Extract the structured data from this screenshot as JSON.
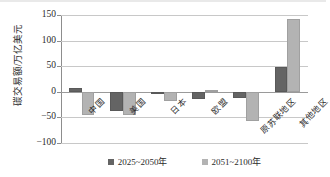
{
  "chart_data": {
    "type": "bar",
    "title": "",
    "xlabel": "",
    "ylabel": "碳交易额/万亿美元",
    "ylim": [
      -100,
      150
    ],
    "yticks": [
      150,
      100,
      50,
      0,
      -50,
      -100
    ],
    "ytick_labels": [
      "150",
      "100",
      "50",
      "0",
      "−50",
      "−100"
    ],
    "grid": true,
    "legend_position": "bottom-center",
    "categories": [
      "中国",
      "美国",
      "日本",
      "欧盟",
      "原苏联地区",
      "其他地区"
    ],
    "series": [
      {
        "name": "2025~2050年",
        "color": "#646464",
        "values": [
          8,
          -38,
          -4,
          -14,
          -12,
          48
        ]
      },
      {
        "name": "2051~2100年",
        "color": "#b3b3b3",
        "values": [
          -45,
          -45,
          -18,
          3,
          -58,
          142
        ]
      }
    ]
  },
  "legend": {
    "entries": [
      {
        "label": "2025~2050年",
        "swatch": "series-0-swatch"
      },
      {
        "label": "2051~2100年",
        "swatch": "series-1-swatch"
      }
    ]
  }
}
